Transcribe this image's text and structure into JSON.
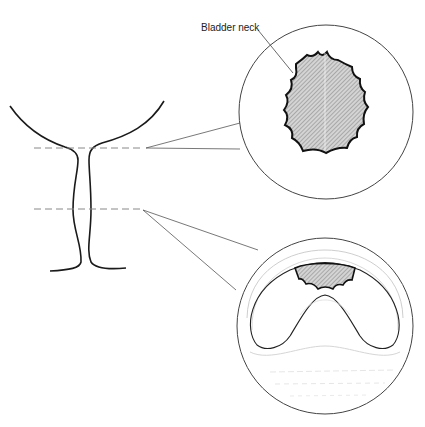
{
  "diagram": {
    "labels": {
      "bladder_neck": "Bladder neck"
    },
    "colors": {
      "stroke": "#1a1a1a",
      "thin_stroke": "#555555",
      "faint_stroke": "#c8c8c8",
      "hatch_fill": "#bdbdbd",
      "background": "#ffffff"
    },
    "sections": [
      {
        "name": "upper-section",
        "level_y": 148,
        "circle": {
          "cx": 326,
          "cy": 112,
          "r": 87
        }
      },
      {
        "name": "lower-section",
        "level_y": 210,
        "circle": {
          "cx": 325,
          "cy": 326,
          "r": 88
        }
      }
    ]
  }
}
